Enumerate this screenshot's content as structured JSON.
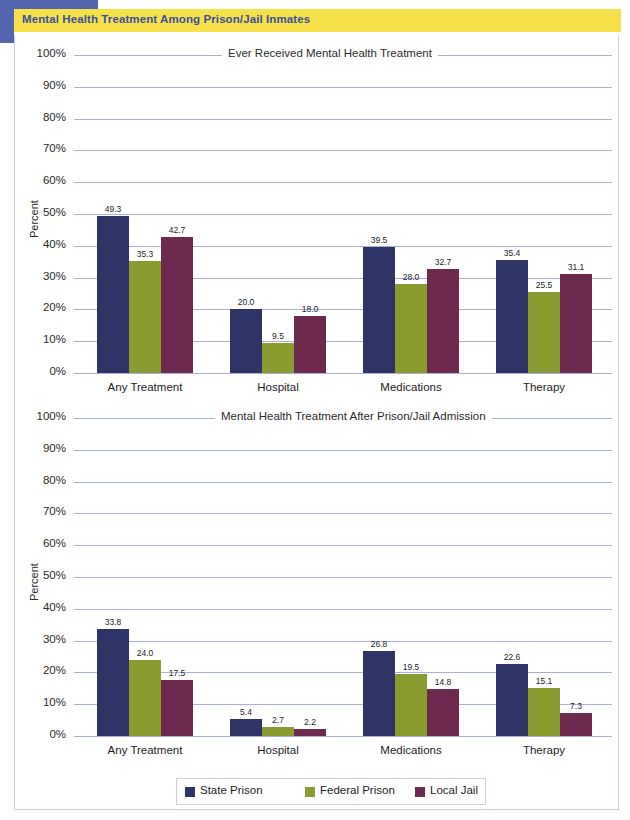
{
  "banner": {
    "title": "Mental Health Treatment Among Prison/Jail Inmates"
  },
  "legend": {
    "items": [
      {
        "label": "State Prison",
        "color": "#2e3566"
      },
      {
        "label": "Federal Prison",
        "color": "#8a9b2f"
      },
      {
        "label": "Local Jail",
        "color": "#6d2a4e"
      }
    ]
  },
  "chart_data": [
    {
      "type": "bar",
      "title": "Ever Received Mental Health Treatment",
      "xlabel": "",
      "ylabel": "Percent",
      "ylim": [
        0,
        100
      ],
      "ytick_labels": [
        "100%",
        "90%",
        "80%",
        "70%",
        "60%",
        "50%",
        "40%",
        "30%",
        "20%",
        "10%",
        "0%"
      ],
      "ytick_values": [
        100,
        90,
        80,
        70,
        60,
        50,
        40,
        30,
        20,
        10,
        0
      ],
      "grid": true,
      "legend_position": "bottom",
      "categories": [
        "Any Treatment",
        "Hospital",
        "Medications",
        "Therapy"
      ],
      "series": [
        {
          "name": "State Prison",
          "color": "#2e3566",
          "values": [
            49.3,
            20.0,
            39.5,
            35.4
          ],
          "labels": [
            "49.3",
            "20.0",
            "39.5",
            "35.4"
          ]
        },
        {
          "name": "Federal Prison",
          "color": "#8a9b2f",
          "values": [
            35.3,
            9.5,
            28.0,
            25.5
          ],
          "labels": [
            "35.3",
            "9.5",
            "28.0",
            "25.5"
          ]
        },
        {
          "name": "Local Jail",
          "color": "#6d2a4e",
          "values": [
            42.7,
            18.0,
            32.7,
            31.1
          ],
          "labels": [
            "42.7",
            "18.0",
            "32.7",
            "31.1"
          ]
        }
      ]
    },
    {
      "type": "bar",
      "title": "Mental Health Treatment After Prison/Jail Admission",
      "xlabel": "",
      "ylabel": "Percent",
      "ylim": [
        0,
        100
      ],
      "ytick_labels": [
        "100%",
        "90%",
        "80%",
        "70%",
        "60%",
        "50%",
        "40%",
        "30%",
        "20%",
        "10%",
        "0%"
      ],
      "ytick_values": [
        100,
        90,
        80,
        70,
        60,
        50,
        40,
        30,
        20,
        10,
        0
      ],
      "grid": true,
      "legend_position": "bottom",
      "categories": [
        "Any Treatment",
        "Hospital",
        "Medications",
        "Therapy"
      ],
      "series": [
        {
          "name": "State Prison",
          "color": "#2e3566",
          "values": [
            33.8,
            5.4,
            26.8,
            22.6
          ],
          "labels": [
            "33.8",
            "5.4",
            "26.8",
            "22.6"
          ]
        },
        {
          "name": "Federal Prison",
          "color": "#8a9b2f",
          "values": [
            24.0,
            2.7,
            19.5,
            15.1
          ],
          "labels": [
            "24.0",
            "2.7",
            "19.5",
            "15.1"
          ]
        },
        {
          "name": "Local Jail",
          "color": "#6d2a4e",
          "values": [
            17.5,
            2.2,
            14.8,
            7.3
          ],
          "labels": [
            "17.5",
            "2.2",
            "14.8",
            "7.3"
          ]
        }
      ]
    }
  ]
}
